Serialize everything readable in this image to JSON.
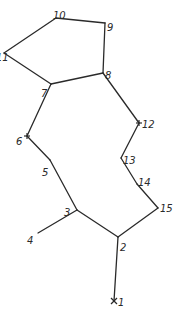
{
  "diagram": {
    "type": "atom-numbered skeletal structure",
    "nodes": [
      {
        "id": "1",
        "label": "1",
        "x": 114,
        "y": 301,
        "marker": "x",
        "lx": 118,
        "ly": 302
      },
      {
        "id": "2",
        "label": "2",
        "x": 118,
        "y": 237,
        "lx": 120,
        "ly": 247
      },
      {
        "id": "3",
        "label": "3",
        "x": 77,
        "y": 210,
        "lx": 64,
        "ly": 212
      },
      {
        "id": "4",
        "label": "4",
        "x": 38,
        "y": 233,
        "lx": 27,
        "ly": 240
      },
      {
        "id": "5",
        "label": "5",
        "x": 50,
        "y": 160,
        "lx": 42,
        "ly": 172
      },
      {
        "id": "6",
        "label": "6",
        "x": 27,
        "y": 136,
        "marker": "+",
        "lx": 16,
        "ly": 141
      },
      {
        "id": "7",
        "label": "7",
        "x": 51,
        "y": 84,
        "lx": 41,
        "ly": 93
      },
      {
        "id": "8",
        "label": "8",
        "x": 103,
        "y": 73,
        "lx": 105,
        "ly": 75
      },
      {
        "id": "9",
        "label": "9",
        "x": 105,
        "y": 23,
        "lx": 107,
        "ly": 27
      },
      {
        "id": "10",
        "label": "10",
        "x": 56,
        "y": 18,
        "lx": 53,
        "ly": 15
      },
      {
        "id": "11",
        "label": "11",
        "x": 4,
        "y": 53,
        "lx": -4,
        "ly": 57
      },
      {
        "id": "12",
        "label": "12",
        "x": 139,
        "y": 123,
        "marker": "+",
        "lx": 142,
        "ly": 124
      },
      {
        "id": "13",
        "label": "13",
        "x": 121,
        "y": 158,
        "lx": 123,
        "ly": 160
      },
      {
        "id": "14",
        "label": "14",
        "x": 137,
        "y": 184,
        "lx": 138,
        "ly": 182
      },
      {
        "id": "15",
        "label": "15",
        "x": 158,
        "y": 208,
        "lx": 160,
        "ly": 208
      }
    ],
    "edges": [
      [
        "1",
        "2"
      ],
      [
        "2",
        "3"
      ],
      [
        "3",
        "4"
      ],
      [
        "3",
        "5"
      ],
      [
        "5",
        "6"
      ],
      [
        "6",
        "7"
      ],
      [
        "7",
        "11"
      ],
      [
        "11",
        "10"
      ],
      [
        "10",
        "9"
      ],
      [
        "9",
        "8"
      ],
      [
        "8",
        "7"
      ],
      [
        "8",
        "12"
      ],
      [
        "12",
        "13"
      ],
      [
        "13",
        "14"
      ],
      [
        "14",
        "15"
      ],
      [
        "15",
        "2"
      ]
    ]
  }
}
